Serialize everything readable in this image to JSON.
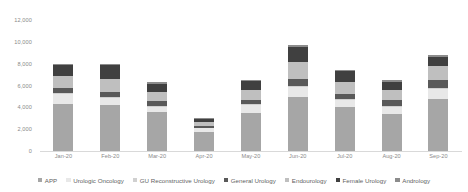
{
  "chart_data": {
    "type": "bar",
    "stacked": true,
    "title": "",
    "xlabel": "",
    "ylabel": "",
    "ylim": [
      0,
      12000
    ],
    "yticks": [
      0,
      2000,
      4000,
      6000,
      8000,
      10000,
      12000
    ],
    "ytick_labels": [
      "0",
      "2,000",
      "4,000",
      "6,000",
      "8,000",
      "10,000",
      "12,000"
    ],
    "grid": false,
    "legend_position": "bottom",
    "categories": [
      "Jan-20",
      "Feb-20",
      "Mar-20",
      "Apr-20",
      "May-20",
      "Jun-20",
      "Jul-20",
      "Aug-20",
      "Sep-20"
    ],
    "series": [
      {
        "name": "APP",
        "color": "#a6a6a6",
        "values": [
          4300,
          4200,
          3550,
          1750,
          3500,
          4950,
          4050,
          3350,
          4800
        ]
      },
      {
        "name": "Urologic Oncology",
        "color": "#e8e8e8",
        "values": [
          900,
          650,
          500,
          350,
          700,
          900,
          600,
          700,
          850
        ]
      },
      {
        "name": "GU Reconstructive Urology",
        "color": "#d0d0d0",
        "values": [
          120,
          110,
          80,
          40,
          100,
          130,
          90,
          80,
          100
        ]
      },
      {
        "name": "General Urology",
        "color": "#595959",
        "values": [
          450,
          480,
          420,
          180,
          380,
          620,
          500,
          520,
          750
        ]
      },
      {
        "name": "Endourology",
        "color": "#bfbfbf",
        "values": [
          1100,
          1150,
          830,
          350,
          900,
          1550,
          1100,
          900,
          1250
        ]
      },
      {
        "name": "Female Urology",
        "color": "#404040",
        "values": [
          1000,
          1250,
          800,
          300,
          850,
          1400,
          950,
          800,
          850
        ]
      },
      {
        "name": "Andrology",
        "color": "#8c8c8c",
        "values": [
          130,
          160,
          120,
          30,
          120,
          150,
          110,
          150,
          200
        ]
      }
    ],
    "totals": [
      8000,
      8000,
      6300,
      3000,
      6550,
      9700,
      7400,
      6500,
      8800
    ]
  }
}
